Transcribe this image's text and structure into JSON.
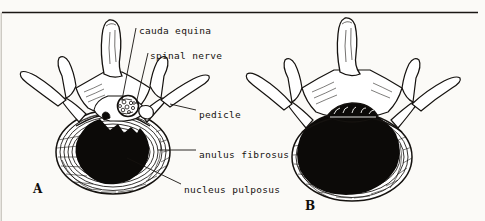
{
  "figure": {
    "background_color": "#fbfaf7",
    "ink_color": "#15120f",
    "top_rule": true
  },
  "labels": [
    {
      "id": "cauda-equina",
      "text": "cauda equina",
      "x": 139,
      "y": 26
    },
    {
      "id": "spinal-nerve",
      "text": "spinal nerve",
      "x": 150,
      "y": 51
    },
    {
      "id": "pedicle",
      "text": "pedicle",
      "x": 199,
      "y": 110
    },
    {
      "id": "anulus-fibrosus",
      "text": "anulus fibrosus",
      "x": 199,
      "y": 150
    },
    {
      "id": "nucleus-pulposus",
      "text": "nucleus pulposus",
      "x": 184,
      "y": 185
    }
  ],
  "panels": [
    {
      "id": "panel-a",
      "letter": "A",
      "x": 33,
      "y": 183,
      "caption": "normal vertebra with round spinal canal and small central nucleus pulposus"
    },
    {
      "id": "panel-b",
      "letter": "B",
      "x": 305,
      "y": 200,
      "caption": "degenerated disc with enlarged nucleus and narrowed slit-like spinal canal"
    }
  ],
  "structures": [
    "spinous process",
    "lamina",
    "superior articular process",
    "transverse process",
    "pedicle",
    "vertebral body",
    "anulus fibrosus",
    "nucleus pulposus",
    "spinal canal",
    "cauda equina",
    "spinal nerve"
  ]
}
